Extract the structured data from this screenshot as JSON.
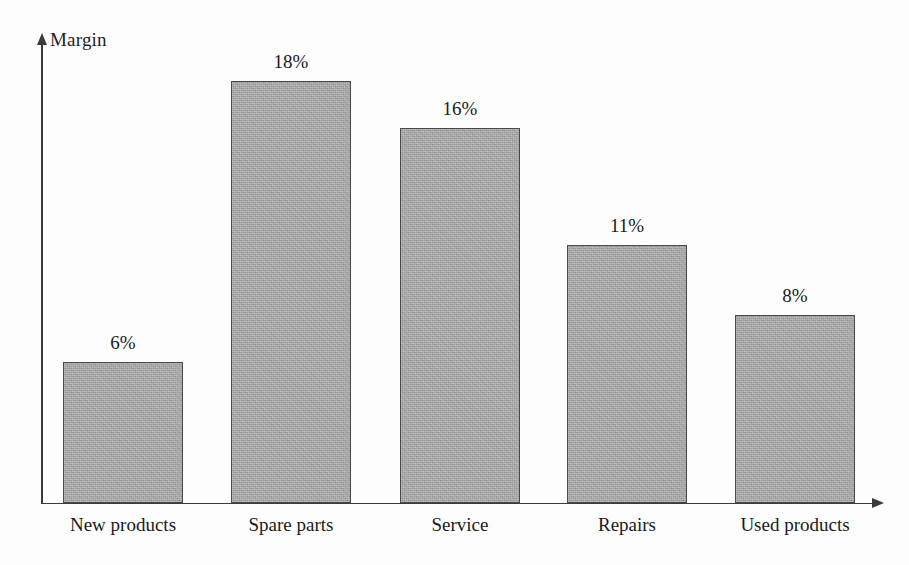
{
  "chart_data": {
    "type": "bar",
    "title": "",
    "subtitle": "",
    "xlabel": "",
    "ylabel": "Margin",
    "categories": [
      "New products",
      "Spare parts",
      "Service",
      "Repairs",
      "Used products"
    ],
    "values": [
      6,
      18,
      16,
      11,
      8
    ],
    "value_labels": [
      "6%",
      "18%",
      "16%",
      "11%",
      "8%"
    ],
    "unit": "%",
    "ylim": [
      0,
      19.5
    ],
    "grid": false,
    "legend": null,
    "legend_position": "none",
    "axis_ticks": {
      "x": [
        "New products",
        "Spare parts",
        "Service",
        "Repairs",
        "Used products"
      ],
      "y": []
    },
    "annotations": [],
    "series": [
      {
        "name": "Margin",
        "values": [
          6,
          18,
          16,
          11,
          8
        ]
      }
    ],
    "style": {
      "bar_fill": "#a9a9a9",
      "bar_border": "#4a4a4a",
      "axis_color": "#3a3a3a",
      "text_color": "#1a1a1a",
      "background": "#fdfdfd"
    }
  },
  "axes": {
    "y_axis_title": "Margin",
    "y_axis_arrow_icon": "arrow-up-icon",
    "x_axis_arrow_icon": "arrow-right-icon"
  },
  "bars": [
    {
      "category": "New products",
      "value": 6,
      "value_label": "6%"
    },
    {
      "category": "Spare parts",
      "value": 18,
      "value_label": "18%"
    },
    {
      "category": "Service",
      "value": 16,
      "value_label": "16%"
    },
    {
      "category": "Repairs",
      "value": 11,
      "value_label": "11%"
    },
    {
      "category": "Used products",
      "value": 8,
      "value_label": "8%"
    }
  ]
}
